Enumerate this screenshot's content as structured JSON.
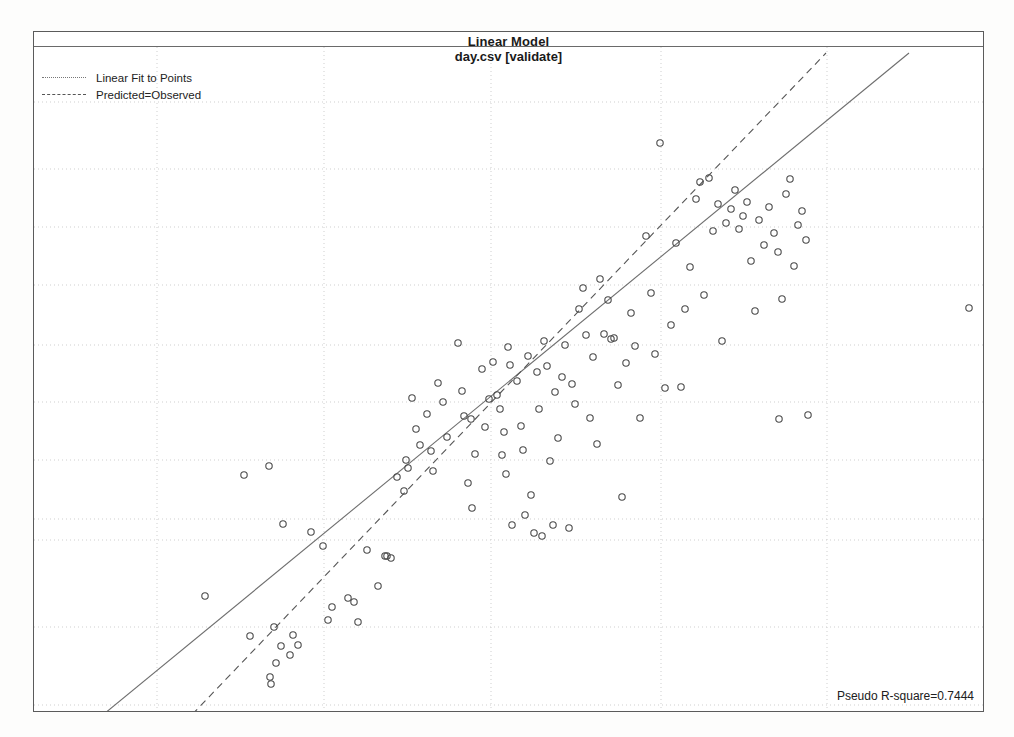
{
  "window": {
    "title": "Linear Model",
    "subtitle": "day.csv [validate]"
  },
  "legend": {
    "position": "top-left",
    "items": [
      {
        "label": "Linear Fit to Points",
        "style": "dotted",
        "color": "#777777",
        "icon": "line-dotted-icon"
      },
      {
        "label": "Predicted=Observed",
        "style": "dashed",
        "color": "#555555",
        "icon": "line-dashed-icon"
      }
    ]
  },
  "annotation": {
    "rsquare_label": "Pseudo R-square=0.7444"
  },
  "chart_data": {
    "type": "scatter",
    "title": "Linear Model",
    "subtitle": "day.csv [validate]",
    "xlabel": "",
    "ylabel": "",
    "xlim": [
      0,
      949
    ],
    "ylim": [
      0,
      664
    ],
    "grid": true,
    "grid_color": "#cfcfcf",
    "marker": {
      "shape": "circle-open",
      "radius": 3.2,
      "stroke": "#4a4a4a",
      "stroke_width": 1.1,
      "fill": "none"
    },
    "legend_position": "top-left",
    "annotations": [
      {
        "text": "Pseudo R-square=0.7444",
        "position": "bottom-right"
      }
    ],
    "gridlines": {
      "vertical_x": [
        123,
        290,
        457,
        627,
        793,
        960
      ],
      "horizontal_y": [
        70,
        137,
        195,
        253,
        313,
        370,
        428,
        487,
        508,
        595,
        673
      ]
    },
    "series": [
      {
        "name": "Linear Fit to Points",
        "type": "line",
        "style": "solid",
        "color": "#6e6e6e",
        "points": [
          [
            59,
            676
          ],
          [
            875,
            6
          ]
        ]
      },
      {
        "name": "Predicted=Observed",
        "type": "line",
        "style": "dashed",
        "color": "#555555",
        "points": [
          [
            150,
            676
          ],
          [
            792,
            6
          ]
        ]
      },
      {
        "name": "Observations",
        "type": "scatter",
        "points": [
          [
            171,
            549
          ],
          [
            216,
            589
          ],
          [
            236,
            630
          ],
          [
            237,
            637
          ],
          [
            240,
            580
          ],
          [
            242,
            616
          ],
          [
            247,
            599
          ],
          [
            256,
            608
          ],
          [
            259,
            588
          ],
          [
            264,
            598
          ],
          [
            210,
            428
          ],
          [
            235,
            419
          ],
          [
            249,
            477
          ],
          [
            277,
            485
          ],
          [
            289,
            499
          ],
          [
            294,
            573
          ],
          [
            298,
            560
          ],
          [
            314,
            551
          ],
          [
            320,
            555
          ],
          [
            324,
            575
          ],
          [
            333,
            503
          ],
          [
            344,
            539
          ],
          [
            351,
            509
          ],
          [
            353,
            509
          ],
          [
            357,
            511
          ],
          [
            363,
            430
          ],
          [
            370,
            444
          ],
          [
            372,
            413
          ],
          [
            374,
            421
          ],
          [
            378,
            351
          ],
          [
            382,
            382
          ],
          [
            386,
            398
          ],
          [
            393,
            367
          ],
          [
            397,
            404
          ],
          [
            399,
            424
          ],
          [
            404,
            336
          ],
          [
            409,
            355
          ],
          [
            413,
            390
          ],
          [
            424,
            296
          ],
          [
            428,
            344
          ],
          [
            430,
            369
          ],
          [
            434,
            436
          ],
          [
            437,
            372
          ],
          [
            438,
            461
          ],
          [
            441,
            407
          ],
          [
            448,
            322
          ],
          [
            451,
            380
          ],
          [
            455,
            352
          ],
          [
            459,
            315
          ],
          [
            463,
            348
          ],
          [
            466,
            362
          ],
          [
            468,
            408
          ],
          [
            470,
            385
          ],
          [
            472,
            427
          ],
          [
            474,
            300
          ],
          [
            476,
            318
          ],
          [
            478,
            478
          ],
          [
            483,
            334
          ],
          [
            487,
            379
          ],
          [
            489,
            403
          ],
          [
            491,
            468
          ],
          [
            494,
            309
          ],
          [
            497,
            448
          ],
          [
            500,
            486
          ],
          [
            503,
            325
          ],
          [
            505,
            362
          ],
          [
            508,
            489
          ],
          [
            510,
            294
          ],
          [
            513,
            319
          ],
          [
            516,
            414
          ],
          [
            519,
            478
          ],
          [
            521,
            345
          ],
          [
            524,
            391
          ],
          [
            528,
            330
          ],
          [
            531,
            298
          ],
          [
            535,
            481
          ],
          [
            538,
            337
          ],
          [
            541,
            357
          ],
          [
            545,
            262
          ],
          [
            549,
            241
          ],
          [
            552,
            288
          ],
          [
            556,
            371
          ],
          [
            559,
            310
          ],
          [
            563,
            397
          ],
          [
            566,
            232
          ],
          [
            570,
            287
          ],
          [
            574,
            253
          ],
          [
            577,
            292
          ],
          [
            580,
            291
          ],
          [
            584,
            338
          ],
          [
            588,
            450
          ],
          [
            592,
            316
          ],
          [
            597,
            266
          ],
          [
            601,
            299
          ],
          [
            606,
            371
          ],
          [
            612,
            189
          ],
          [
            617,
            246
          ],
          [
            621,
            307
          ],
          [
            626,
            96
          ],
          [
            631,
            341
          ],
          [
            637,
            278
          ],
          [
            642,
            196
          ],
          [
            647,
            340
          ],
          [
            651,
            262
          ],
          [
            656,
            220
          ],
          [
            662,
            152
          ],
          [
            666,
            135
          ],
          [
            670,
            248
          ],
          [
            675,
            131
          ],
          [
            679,
            184
          ],
          [
            684,
            157
          ],
          [
            688,
            294
          ],
          [
            692,
            176
          ],
          [
            697,
            162
          ],
          [
            701,
            143
          ],
          [
            705,
            182
          ],
          [
            709,
            169
          ],
          [
            713,
            155
          ],
          [
            717,
            214
          ],
          [
            721,
            264
          ],
          [
            725,
            173
          ],
          [
            730,
            198
          ],
          [
            735,
            160
          ],
          [
            740,
            186
          ],
          [
            744,
            205
          ],
          [
            748,
            252
          ],
          [
            752,
            147
          ],
          [
            756,
            132
          ],
          [
            760,
            219
          ],
          [
            764,
            178
          ],
          [
            768,
            164
          ],
          [
            772,
            193
          ],
          [
            745,
            372
          ],
          [
            774,
            368
          ],
          [
            935,
            261
          ]
        ]
      }
    ]
  }
}
